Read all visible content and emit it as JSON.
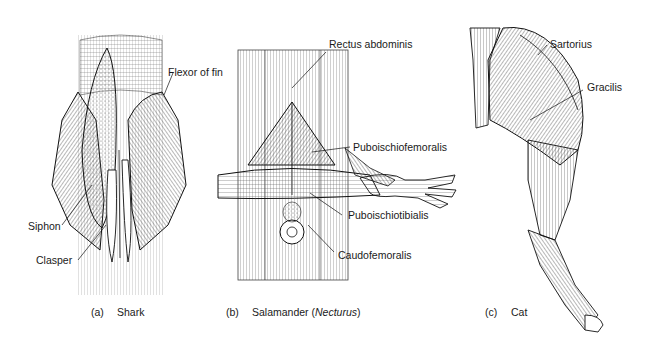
{
  "figure": {
    "panels": [
      {
        "id": "a",
        "caption_tag": "(a)",
        "caption": "Shark",
        "labels": [
          "Flexor of fin",
          "Siphon",
          "Clasper"
        ]
      },
      {
        "id": "b",
        "caption_tag": "(b)",
        "caption": "Salamander (",
        "caption_italic": "Necturus",
        "caption_end": ")",
        "labels": [
          "Rectus abdominis",
          "Puboischiofemoralis",
          "Puboischiotibialis",
          "Caudofemoralis"
        ]
      },
      {
        "id": "c",
        "caption_tag": "(c)",
        "caption": "Cat",
        "labels": [
          "Sartorius",
          "Gracilis"
        ]
      }
    ]
  }
}
